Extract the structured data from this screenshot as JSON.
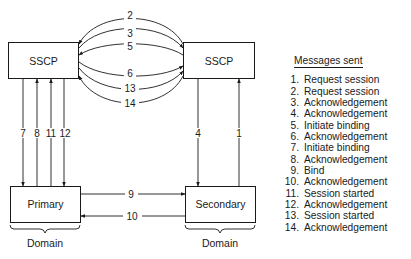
{
  "diagram": {
    "nodes": {
      "sscp_left": {
        "label": "SSCP"
      },
      "sscp_right": {
        "label": "SSCP"
      },
      "primary": {
        "label": "Primary"
      },
      "secondary": {
        "label": "Secondary"
      }
    },
    "domains": [
      {
        "label": "Domain",
        "under": "primary"
      },
      {
        "label": "Domain",
        "under": "secondary"
      }
    ],
    "edges": [
      {
        "num": "1",
        "from": "secondary",
        "to": "sscp_right"
      },
      {
        "num": "2",
        "from": "sscp_right",
        "to": "sscp_left"
      },
      {
        "num": "3",
        "from": "sscp_left",
        "to": "sscp_right"
      },
      {
        "num": "4",
        "from": "sscp_right",
        "to": "secondary"
      },
      {
        "num": "5",
        "from": "sscp_right",
        "to": "sscp_left"
      },
      {
        "num": "6",
        "from": "sscp_left",
        "to": "sscp_right"
      },
      {
        "num": "7",
        "from": "sscp_left",
        "to": "primary"
      },
      {
        "num": "8",
        "from": "primary",
        "to": "sscp_left"
      },
      {
        "num": "9",
        "from": "primary",
        "to": "secondary"
      },
      {
        "num": "10",
        "from": "secondary",
        "to": "primary"
      },
      {
        "num": "11",
        "from": "primary",
        "to": "sscp_left"
      },
      {
        "num": "12",
        "from": "sscp_left",
        "to": "primary"
      },
      {
        "num": "13",
        "from": "sscp_left",
        "to": "sscp_right"
      },
      {
        "num": "14",
        "from": "sscp_right",
        "to": "sscp_left"
      }
    ]
  },
  "legend": {
    "title": "Messages sent",
    "items": [
      {
        "num": "1.",
        "text": "Request session"
      },
      {
        "num": "2.",
        "text": "Request session"
      },
      {
        "num": "3.",
        "text": "Acknowledgement"
      },
      {
        "num": "4.",
        "text": "Acknowledgement"
      },
      {
        "num": "5.",
        "text": "Initiate binding"
      },
      {
        "num": "6.",
        "text": "Acknowledgement"
      },
      {
        "num": "7.",
        "text": "Initiate binding"
      },
      {
        "num": "8.",
        "text": "Acknowledgement"
      },
      {
        "num": "9.",
        "text": "Bind"
      },
      {
        "num": "10.",
        "text": "Acknowledgement"
      },
      {
        "num": "11.",
        "text": "Session started"
      },
      {
        "num": "12.",
        "text": "Acknowledgement"
      },
      {
        "num": "13.",
        "text": "Session started"
      },
      {
        "num": "14.",
        "text": "Acknowledgement"
      }
    ]
  }
}
